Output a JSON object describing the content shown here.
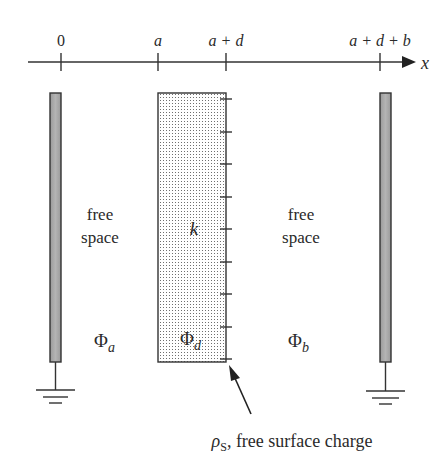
{
  "axis": {
    "variable": "x",
    "ticks": [
      {
        "label": "0",
        "x": 61
      },
      {
        "label": "a",
        "x": 158
      },
      {
        "label": "a + d",
        "x": 226
      },
      {
        "label": "a + d + b",
        "x": 380
      }
    ]
  },
  "regions": {
    "left": {
      "line1": "free",
      "line2": "space",
      "potential": "Φ",
      "potential_sub": "a"
    },
    "dielectric": {
      "constant": "k",
      "potential": "Φ",
      "potential_sub": "d"
    },
    "right": {
      "line1": "free",
      "line2": "space",
      "potential": "Φ",
      "potential_sub": "b"
    }
  },
  "annotation": {
    "symbol": "ρ",
    "symbol_sub": "S",
    "text": ", free surface charge"
  },
  "colors": {
    "line": "#333333",
    "plate_fill": "#a8a8a8",
    "dots": "#7a7a7a"
  }
}
